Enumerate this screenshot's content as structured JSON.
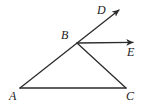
{
  "figure": {
    "background_color": "#ffffff",
    "stroke_color": "#2b2b2b",
    "label_color": "#1a1a1a",
    "stroke_width": 1.3,
    "width": 145,
    "height": 110
  },
  "points": {
    "A": {
      "label": "A",
      "x": 20,
      "y": 88,
      "label_x": 9,
      "label_y": 90
    },
    "B": {
      "label": "B",
      "x": 77,
      "y": 43,
      "label_x": 61,
      "label_y": 29
    },
    "C": {
      "label": "C",
      "x": 126,
      "y": 88,
      "label_x": 126,
      "label_y": 90
    },
    "D": {
      "label": "D",
      "x": 122,
      "y": 7,
      "label_x": 97,
      "label_y": 4
    },
    "E": {
      "label": "E",
      "x": 138,
      "y": 42,
      "label_x": 127,
      "label_y": 46
    }
  },
  "segments": [
    {
      "name": "segment-AC",
      "from": "A",
      "to": "C",
      "arrow": false
    },
    {
      "name": "segment-AB-extended-to-D",
      "from": "A",
      "to": "D",
      "arrow": true
    },
    {
      "name": "segment-BC",
      "from": "B",
      "to": "C",
      "arrow": false
    },
    {
      "name": "ray-BE",
      "from": "B",
      "to": "E",
      "arrow": true
    }
  ],
  "labels": [
    "A",
    "B",
    "C",
    "D",
    "E"
  ]
}
